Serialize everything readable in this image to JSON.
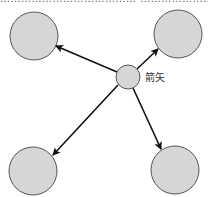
{
  "diagram": {
    "top_text": "………………………………… …………………………………",
    "center_node": {
      "cx": 128,
      "cy": 77,
      "r": 12,
      "label": "箭矢"
    },
    "outer_nodes": [
      {
        "id": "top-left",
        "cx": 34,
        "cy": 36,
        "r": 24
      },
      {
        "id": "top-right",
        "cx": 178,
        "cy": 34,
        "r": 24
      },
      {
        "id": "bottom-left",
        "cx": 33,
        "cy": 171,
        "r": 24
      },
      {
        "id": "bottom-right",
        "cx": 175,
        "cy": 170,
        "r": 24
      }
    ],
    "colors": {
      "node_fill": "#d6d6d6",
      "node_stroke": "#555555",
      "arrow": "#111111"
    }
  }
}
